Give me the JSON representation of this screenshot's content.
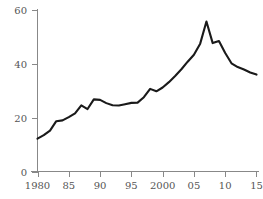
{
  "chart_data": {
    "type": "line",
    "title": "",
    "subtitle": "",
    "xlabel": "",
    "ylabel": "",
    "xlim": [
      1979.2,
      2015.2
    ],
    "ylim": [
      0,
      60
    ],
    "grid": false,
    "legend": null,
    "xticks": [
      1980,
      1985,
      1990,
      1995,
      2000,
      2005,
      2010,
      2015
    ],
    "xtick_labels": [
      "1980",
      "85",
      "90",
      "95",
      "2000",
      "05",
      "10",
      "15"
    ],
    "yticks": [
      0,
      20,
      40,
      60
    ],
    "ytick_labels": [
      "0",
      "20",
      "40",
      "60"
    ],
    "series": [
      {
        "name": "value",
        "color": "#1a1a1a",
        "x": [
          1980,
          1981,
          1982,
          1983,
          1984,
          1985,
          1986,
          1987,
          1988,
          1989,
          1990,
          1991,
          1992,
          1993,
          1994,
          1995,
          1996,
          1997,
          1998,
          1999,
          2000,
          2001,
          2002,
          2003,
          2004,
          2005,
          2006,
          2007,
          2008,
          2009,
          2010,
          2011,
          2012,
          2013,
          2014,
          2015
        ],
        "values": [
          12.2,
          13.5,
          15.2,
          18.7,
          19.0,
          20.2,
          21.6,
          24.6,
          23.2,
          26.8,
          26.6,
          25.4,
          24.6,
          24.5,
          25.0,
          25.5,
          25.6,
          27.6,
          30.7,
          29.8,
          31.2,
          33.2,
          35.5,
          38.0,
          40.8,
          43.4,
          47.5,
          55.7,
          47.7,
          48.5,
          44.0,
          40.2,
          38.8,
          37.9,
          36.8,
          36.0
        ]
      }
    ]
  },
  "axes": {
    "y_axis_name": "value-axis",
    "x_axis_name": "year-axis"
  }
}
